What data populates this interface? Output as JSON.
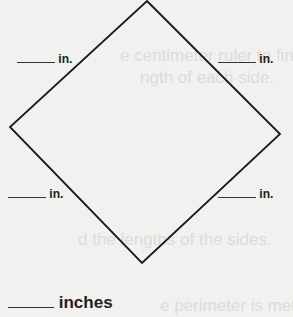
{
  "shape": {
    "type": "square-rotated-45",
    "stroke": "#1a1a1a"
  },
  "side_labels": [
    {
      "position": "top-left",
      "unit": "in."
    },
    {
      "position": "top-right",
      "unit": "in."
    },
    {
      "position": "bottom-left",
      "unit": "in."
    },
    {
      "position": "bottom-right",
      "unit": "in."
    }
  ],
  "perimeter": {
    "unit": "inches"
  },
  "bleed_through_text": {
    "line1": "e centimeter ruler to find the",
    "line2": "ngth of each side.",
    "line3": "d the lengths of the sides.",
    "line4": "e perimeter is        meters."
  }
}
